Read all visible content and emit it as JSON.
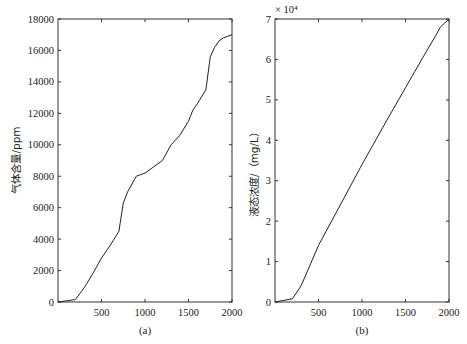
{
  "chart_data": [
    {
      "type": "line",
      "panel": "(a)",
      "title": "",
      "xlabel": "",
      "ylabel": "气体含量/ppm",
      "xlim": [
        0,
        2000
      ],
      "ylim": [
        0,
        18000
      ],
      "xticks": [
        500,
        1000,
        1500,
        2000
      ],
      "yticks": [
        0,
        2000,
        4000,
        6000,
        8000,
        10000,
        12000,
        14000,
        16000,
        18000
      ],
      "grid": false,
      "caption": "(a)",
      "x": [
        0,
        200,
        300,
        400,
        500,
        600,
        700,
        750,
        800,
        900,
        1000,
        1100,
        1200,
        1300,
        1400,
        1500,
        1550,
        1600,
        1700,
        1750,
        1800,
        1850,
        1900,
        2000
      ],
      "series": [
        {
          "name": "气体含量",
          "values": [
            0,
            150,
            900,
            1800,
            2800,
            3600,
            4500,
            6300,
            7000,
            8000,
            8200,
            8600,
            9000,
            10000,
            10600,
            11500,
            12200,
            12600,
            13500,
            15600,
            16200,
            16600,
            16800,
            17000
          ]
        }
      ]
    },
    {
      "type": "line",
      "panel": "(b)",
      "title": "",
      "xlabel": "",
      "ylabel": "液态浓度/（mg/L）",
      "y_multiplier": "× 10⁴",
      "xlim": [
        0,
        2000
      ],
      "ylim": [
        0,
        7
      ],
      "xticks": [
        500,
        1000,
        1500,
        2000
      ],
      "yticks": [
        0,
        1,
        2,
        3,
        4,
        5,
        6,
        7
      ],
      "grid": false,
      "caption": "(b)",
      "x": [
        0,
        200,
        300,
        400,
        500,
        700,
        1000,
        1300,
        1500,
        1700,
        1850,
        1900,
        2000
      ],
      "series": [
        {
          "name": "液态浓度",
          "values": [
            0,
            0.08,
            0.4,
            0.9,
            1.4,
            2.2,
            3.4,
            4.55,
            5.3,
            6.05,
            6.6,
            6.8,
            7.0
          ]
        }
      ]
    }
  ],
  "panels": {
    "a": {
      "ylabel": "气体含量/ppm",
      "caption": "(a)",
      "xtick_labels": [
        "500",
        "1000",
        "1500",
        "2000"
      ],
      "ytick_labels": [
        "0",
        "2000",
        "4000",
        "6000",
        "8000",
        "10000",
        "12000",
        "14000",
        "16000",
        "18000"
      ]
    },
    "b": {
      "ylabel": "液态浓度/（mg/L）",
      "caption": "(b)",
      "multiplier": "× 10⁴",
      "xtick_labels": [
        "500",
        "1000",
        "1500",
        "2000"
      ],
      "ytick_labels": [
        "0",
        "1",
        "2",
        "3",
        "4",
        "5",
        "6",
        "7"
      ]
    }
  },
  "style": {
    "line_color": "#222222",
    "axis_color": "#333333"
  }
}
